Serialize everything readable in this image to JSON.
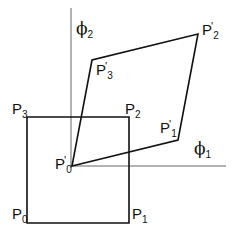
{
  "diagram": {
    "type": "coordinate transformation",
    "axes": {
      "vertical": {
        "label": "ϕ",
        "subscript": "2"
      },
      "horizontal": {
        "label": "ϕ",
        "subscript": "1"
      }
    },
    "square": {
      "points": [
        {
          "label": "P",
          "subscript": "0",
          "prime": ""
        },
        {
          "label": "P",
          "subscript": "1",
          "prime": ""
        },
        {
          "label": "P",
          "subscript": "2",
          "prime": ""
        },
        {
          "label": "P",
          "subscript": "3",
          "prime": ""
        }
      ]
    },
    "parallelogram": {
      "points": [
        {
          "label": "P",
          "subscript": "0",
          "prime": "'"
        },
        {
          "label": "P",
          "subscript": "1",
          "prime": "'"
        },
        {
          "label": "P",
          "subscript": "2",
          "prime": "'"
        },
        {
          "label": "P",
          "subscript": "3",
          "prime": "'"
        }
      ]
    },
    "colors": {
      "stroke": "#111111",
      "axis": "#555555",
      "background": "#ffffff"
    }
  }
}
